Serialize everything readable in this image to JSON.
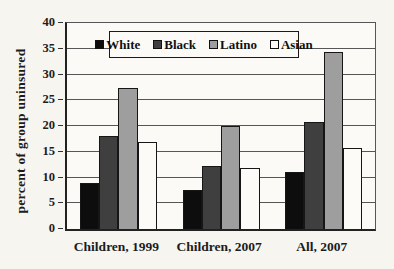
{
  "colors": {
    "background": "#f6f5f0",
    "plot_background": "#fbfaf6",
    "axis": "#222222",
    "grid": "#565656",
    "bar_border": "#161616",
    "text": "#1c1c1c"
  },
  "chart_data": {
    "type": "bar",
    "title": "",
    "xlabel": "",
    "ylabel": "percent of group uninsured",
    "ylim": [
      0,
      40
    ],
    "yticks": [
      0,
      5,
      10,
      15,
      20,
      25,
      30,
      35,
      40
    ],
    "grid": "horizontal",
    "legend_position": "top-inside",
    "legend_labels": [
      "White",
      "Black",
      "Latino",
      "Asian"
    ],
    "categories": [
      "Children, 1999",
      "Children, 2007",
      "All, 2007"
    ],
    "series": [
      {
        "name": "White",
        "color": "#0d0d0d",
        "values": [
          8.9,
          7.5,
          11.0
        ]
      },
      {
        "name": "Black",
        "color": "#3f3f3f",
        "values": [
          18.0,
          12.3,
          20.7
        ]
      },
      {
        "name": "Latino",
        "color": "#9e9e9e",
        "values": [
          27.3,
          20.0,
          34.3
        ]
      },
      {
        "name": "Asian",
        "color": "#fcfbf7",
        "values": [
          16.8,
          11.8,
          15.7
        ]
      }
    ]
  }
}
